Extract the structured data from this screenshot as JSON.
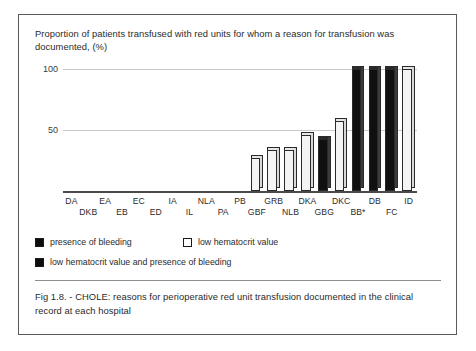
{
  "figure": {
    "title": "Proportion of patients  transfused with red units for whom a reason for transfusion was documented,  (%)",
    "caption": "Fig 1.8. - CHOLE:  reasons for perioperative red unit transfusion documented in the clinical record at each hospital"
  },
  "legend": {
    "items": [
      {
        "label": "presence of bleeding",
        "swatch": "black",
        "key": "bleeding"
      },
      {
        "label": "low hematocrit value",
        "swatch": "white",
        "key": "hematocrit"
      },
      {
        "label": "low hematocrit value and  presence of bleeding",
        "swatch": "black",
        "key": "both"
      }
    ]
  },
  "chart_data": {
    "type": "bar",
    "title": "Proportion of patients  transfused with red units for whom a reason for transfusion was documented,  (%)",
    "xlabel": "",
    "ylabel": "",
    "ylim": [
      0,
      100
    ],
    "yticks": [
      50,
      100
    ],
    "ytick_labels": [
      "50",
      "100"
    ],
    "grid": true,
    "legend_position": "below-plot",
    "categories": [
      "DA",
      "DKB",
      "EA",
      "EB",
      "EC",
      "ED",
      "IA",
      "IL",
      "NLA",
      "PA",
      "PB",
      "GBF",
      "GRB",
      "NLB",
      "DKA",
      "GBG",
      "DKC",
      "BB*",
      "DB",
      "FC",
      "ID"
    ],
    "values": [
      0,
      0,
      0,
      0,
      0,
      0,
      0,
      0,
      0,
      0,
      0,
      27,
      34,
      34,
      46,
      43,
      57,
      100,
      100,
      100,
      100
    ],
    "fills": [
      "none",
      "none",
      "none",
      "none",
      "none",
      "none",
      "none",
      "none",
      "none",
      "none",
      "none",
      "hematocrit",
      "hematocrit",
      "hematocrit",
      "hematocrit",
      "bleeding",
      "hematocrit",
      "both",
      "both",
      "both",
      "hematocrit"
    ]
  }
}
